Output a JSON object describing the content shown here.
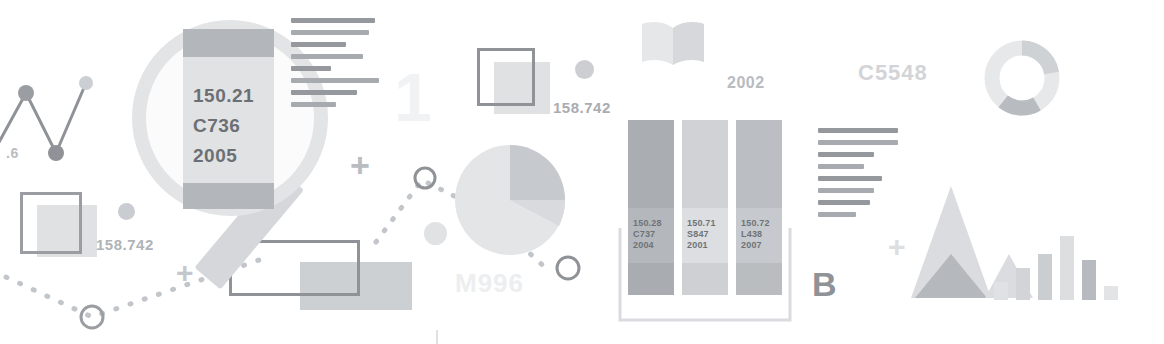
{
  "page": {
    "background": "#ffffff",
    "width": 1164,
    "height": 344,
    "theme": "library-catalog-infographic"
  },
  "palette": {
    "ink_dark": "#6f7377",
    "ink_mid": "#9a9da1",
    "ink_light": "#c9ccd0",
    "ink_faint": "#e3e5e7",
    "ink_ghost": "#f2f3f4",
    "accent_fill": "#d8dade"
  },
  "magnifier": {
    "name": "magnifying-glass",
    "book_label": {
      "call_number": "150.21",
      "cutter": "C736",
      "year": "2005"
    }
  },
  "labels": {
    "axis_fragment": ".6",
    "dewey_left": "158.742",
    "dewey_mid": "158.742",
    "ghost_one": "1",
    "ghost_m996": "M996",
    "year_2002": "2002",
    "ghost_c5548": "C5548",
    "letter_b": "B"
  },
  "shelf": {
    "name": "bookshelf",
    "books": [
      {
        "call_number": "150.28",
        "cutter": "C737",
        "year": "2004",
        "shade": "#b4b7bb",
        "height": 175
      },
      {
        "call_number": "150.71",
        "cutter": "S847",
        "year": "2001",
        "shade": "#dcdee1",
        "height": 175
      },
      {
        "call_number": "150.72",
        "cutter": "L438",
        "year": "2007",
        "shade": "#c6c9cd",
        "height": 175
      }
    ]
  },
  "chart_data": [
    {
      "type": "line",
      "name": "zigzag-line-chart",
      "title": "",
      "x": [
        0,
        1,
        2,
        3
      ],
      "y": [
        0.35,
        0.85,
        0.1,
        0.92
      ],
      "ylabel": "",
      "xlabel": "",
      "tick_labels": [
        ".6"
      ],
      "grid": false,
      "legend": "none",
      "marker_colors": [
        "#b9bcc0",
        "#9a9da1",
        "#9a9da1",
        "#c9ccd0"
      ]
    },
    {
      "type": "pie",
      "name": "pie-chart",
      "title": "",
      "labels": [
        "segment-a",
        "segment-b",
        "segment-c"
      ],
      "values": [
        62,
        20,
        18
      ],
      "colors": [
        "#e1e3e5",
        "#c3c6ca",
        "#d6d8db"
      ],
      "legend": "none"
    },
    {
      "type": "pie",
      "name": "donut-chart",
      "title": "",
      "labels": [
        "segment-a",
        "segment-b",
        "segment-c"
      ],
      "values": [
        60,
        22,
        18
      ],
      "colors": [
        "#e6e8ea",
        "#cfd2d5",
        "#b8bbbf"
      ],
      "hole": 0.6,
      "legend": "none"
    },
    {
      "type": "bar",
      "name": "bar-chart-right",
      "title": "",
      "categories": [
        "1",
        "2",
        "3",
        "4",
        "5",
        "6"
      ],
      "values": [
        22,
        40,
        58,
        80,
        50,
        18
      ],
      "colors": [
        "#dfe1e3",
        "#d2d4d7",
        "#cbced1",
        "#dcdee0",
        "#b7babe",
        "#e2e4e6"
      ],
      "xlabel": "",
      "ylabel": "",
      "ylim": [
        0,
        90
      ],
      "grid": false,
      "legend": "none"
    },
    {
      "type": "bar",
      "name": "triangle-pair-chart",
      "title": "",
      "categories": [
        "a",
        "b"
      ],
      "values": [
        100,
        88
      ],
      "colors": [
        "#b5b8bc",
        "#dadce0"
      ],
      "shape": "triangle",
      "legend": "none"
    }
  ],
  "text_blocks": {
    "near_magnifier": {
      "name": "text-lines-top",
      "line_widths": [
        84,
        78,
        55,
        72,
        40,
        88,
        66,
        45
      ]
    },
    "near_letter_b": {
      "name": "text-lines-right",
      "line_widths": [
        80,
        80,
        56,
        46,
        64,
        56,
        52,
        38
      ]
    }
  },
  "decor": {
    "plus_marks": 3,
    "open_book_icon": "open-book-icon",
    "dotted_paths": 2,
    "outline_squares": 3,
    "small_dots": 5
  }
}
